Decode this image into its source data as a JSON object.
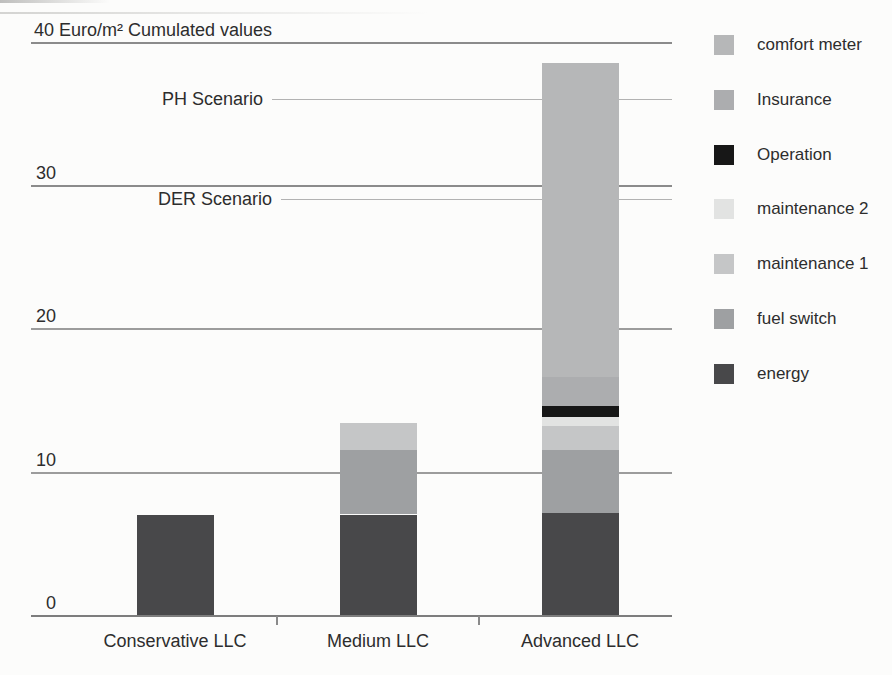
{
  "chart_data": {
    "type": "bar",
    "stacked": true,
    "title": "40 Euro/m² Cumulated values",
    "unit": "Euro/m²",
    "categories": [
      "Conservative LLC",
      "Medium LLC",
      "Advanced LLC"
    ],
    "series": [
      {
        "name": "energy",
        "color": "#48484a",
        "values": [
          7,
          7,
          7.1
        ]
      },
      {
        "name": "fuel switch",
        "color": "#9ea0a2",
        "values": [
          0,
          4.5,
          4.4
        ]
      },
      {
        "name": "maintenance 1",
        "color": "#c5c6c7",
        "values": [
          0,
          1.9,
          1.7
        ]
      },
      {
        "name": "maintenance 2",
        "color": "#e2e3e2",
        "values": [
          0,
          0,
          0.6
        ]
      },
      {
        "name": "Operation",
        "color": "#171717",
        "values": [
          0,
          0,
          0.8
        ]
      },
      {
        "name": "Insurance",
        "color": "#acadaf",
        "values": [
          0,
          0,
          2.0
        ]
      },
      {
        "name": "comfort meter",
        "color": "#b6b7b8",
        "values": [
          0,
          0,
          21.9
        ]
      }
    ],
    "legend_order_top_to_bottom": [
      "comfort meter",
      "Insurance",
      "Operation",
      "maintenance 2",
      "maintenance 1",
      "fuel switch",
      "energy"
    ],
    "yticks": [
      0,
      10,
      20,
      30
    ],
    "ylim": [
      0,
      40
    ],
    "grid": true,
    "legend_position": "right",
    "annotations": [
      {
        "label": "PH Scenario",
        "value": 36
      },
      {
        "label": "DER Scenario",
        "value": 29
      }
    ]
  }
}
